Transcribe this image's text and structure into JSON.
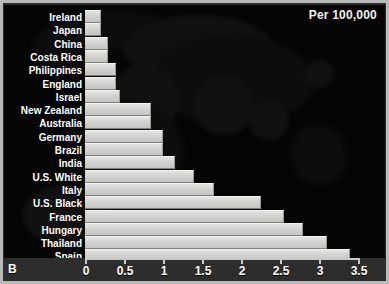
{
  "panel_label": "B",
  "unit_label": "Per 100,000",
  "chart_data": {
    "type": "bar",
    "orientation": "horizontal",
    "title": "",
    "subtitle": "",
    "xlabel": "Per 100,000",
    "ylabel": "",
    "xlim": [
      0,
      3.5
    ],
    "xticks": [
      "0",
      "0.5",
      "1",
      "1.5",
      "2",
      "2.5",
      "3",
      "3.5"
    ],
    "xtick_values": [
      0,
      0.5,
      1,
      1.5,
      2,
      2.5,
      3,
      3.5
    ],
    "grid": false,
    "legend": null,
    "categories": [
      "Ireland",
      "Japan",
      "China",
      "Costa Rica",
      "Philippines",
      "England",
      "Israel",
      "New Zealand",
      "Australia",
      "Germany",
      "Brazil",
      "India",
      "U.S. White",
      "Italy",
      "U.S. Black",
      "France",
      "Hungary",
      "Thailand",
      "Spain"
    ],
    "values": [
      0.2,
      0.2,
      0.3,
      0.3,
      0.4,
      0.4,
      0.45,
      0.85,
      0.85,
      1.0,
      1.0,
      1.15,
      1.4,
      1.65,
      2.25,
      2.55,
      2.8,
      3.1,
      3.4
    ],
    "bars": [
      {
        "label": "Ireland",
        "value": 0.2
      },
      {
        "label": "Japan",
        "value": 0.2
      },
      {
        "label": "China",
        "value": 0.3
      },
      {
        "label": "Costa Rica",
        "value": 0.3
      },
      {
        "label": "Philippines",
        "value": 0.4
      },
      {
        "label": "England",
        "value": 0.4
      },
      {
        "label": "Israel",
        "value": 0.45
      },
      {
        "label": "New Zealand",
        "value": 0.85
      },
      {
        "label": "Australia",
        "value": 0.85
      },
      {
        "label": "Germany",
        "value": 1.0
      },
      {
        "label": "Brazil",
        "value": 1.0
      },
      {
        "label": "India",
        "value": 1.15
      },
      {
        "label": "U.S. White",
        "value": 1.4
      },
      {
        "label": "Italy",
        "value": 1.65
      },
      {
        "label": "U.S. Black",
        "value": 2.25
      },
      {
        "label": "France",
        "value": 2.55
      },
      {
        "label": "Hungary",
        "value": 2.8
      },
      {
        "label": "Thailand",
        "value": 3.1
      },
      {
        "label": "Spain",
        "value": 3.4
      }
    ]
  },
  "colors": {
    "background": "#050505",
    "frame": "#b9b9b9",
    "bar_fill": "#d7d7d4",
    "bar_highlight": "#f3f3f1",
    "bar_shadow": "#7e7e7a",
    "text": "#ffffff",
    "axis": "#c9c9c9",
    "map_silhouette": "#121212"
  }
}
